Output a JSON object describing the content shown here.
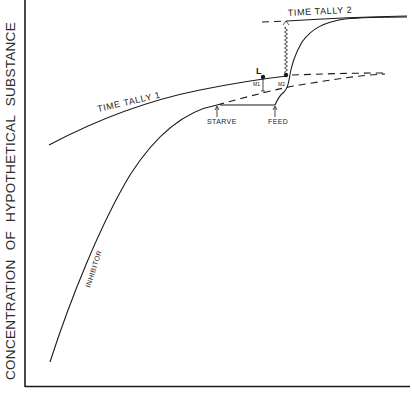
{
  "figure": {
    "y_axis_label": "CONCENTRATION OF HYPOTHETICAL SUBSTANCE",
    "x_axis_label": "",
    "labels": {
      "time_tally_1": "TIME TALLY 1",
      "time_tally_2": "TIME TALLY 2",
      "inhibitor": "INHIBITOR",
      "starve": "STARVE",
      "feed": "FEED",
      "point_l": "L",
      "m1": "M1",
      "m2": "M2"
    },
    "curves": [
      {
        "name": "time-tally-1",
        "style": "solid then dashed",
        "description": "Rising curve flattening toward plateau"
      },
      {
        "name": "inhibitor",
        "style": "solid then dashed",
        "description": "Steep rise from bottom-left, continues dashed after starve"
      },
      {
        "name": "starve-plateau",
        "style": "solid",
        "description": "Horizontal segment from STARVE to FEED"
      },
      {
        "name": "feed-rise",
        "style": "solid",
        "description": "Sharp rise after FEED up to Time Tally 2 level"
      },
      {
        "name": "time-tally-2",
        "style": "dashed then solid",
        "description": "Upper plateau level"
      }
    ],
    "colors": {
      "ink": "#1a1a1a",
      "background": "#ffffff"
    }
  }
}
